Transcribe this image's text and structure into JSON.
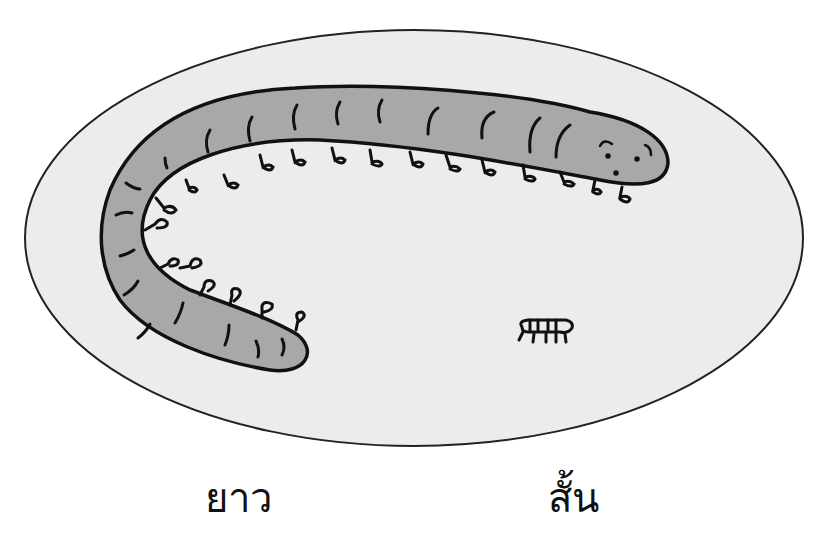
{
  "scene": {
    "background": "#ffffff",
    "ellipse": {
      "fill": "#ececec",
      "stroke": "#222222",
      "cx": 414,
      "cy": 238,
      "rx": 389,
      "ry": 208
    },
    "long_worm": {
      "name": "long-centipede",
      "body_fill": "#a8a8a8",
      "stroke": "#111111",
      "leg_count": 20
    },
    "short_worm": {
      "name": "short-centipede",
      "stroke": "#111111"
    }
  },
  "labels": {
    "long": "ยาว",
    "short": "สั้น"
  }
}
